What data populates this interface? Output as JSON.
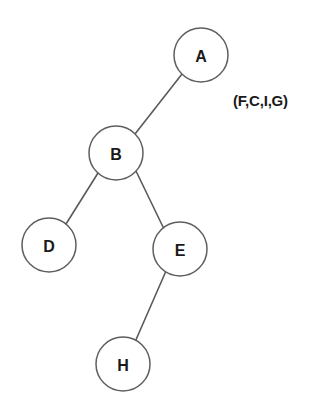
{
  "canvas": {
    "width": 322,
    "height": 414,
    "background": "#ffffff"
  },
  "style": {
    "node_stroke": "#5f5f5f",
    "node_fill": "#ffffff",
    "edge_stroke": "#5a5a5a",
    "label_color": "#1a1a1a"
  },
  "diagram": {
    "type": "tree",
    "title": "",
    "node_radius": 27,
    "nodes": [
      {
        "id": "A",
        "label": "A",
        "cx": 201,
        "cy": 55,
        "r": 27
      },
      {
        "id": "B",
        "label": "B",
        "cx": 116,
        "cy": 153,
        "r": 27
      },
      {
        "id": "D",
        "label": "D",
        "cx": 49,
        "cy": 245,
        "r": 27
      },
      {
        "id": "E",
        "label": "E",
        "cx": 180,
        "cy": 249,
        "r": 27
      },
      {
        "id": "H",
        "label": "H",
        "cx": 123,
        "cy": 364,
        "r": 27
      }
    ],
    "edges": [
      {
        "from": "A",
        "to": "B",
        "x1": 182,
        "y1": 74,
        "x2": 135,
        "y2": 134
      },
      {
        "from": "B",
        "to": "D",
        "x1": 98,
        "y1": 173,
        "x2": 66,
        "y2": 224
      },
      {
        "from": "B",
        "to": "E",
        "x1": 136,
        "y1": 171,
        "x2": 164,
        "y2": 229
      },
      {
        "from": "E",
        "to": "H",
        "x1": 166,
        "y1": 271,
        "x2": 135,
        "y2": 342
      }
    ],
    "annotations": [
      {
        "id": "set-label",
        "text": "(F,C,I,G)",
        "x": 233,
        "y": 92
      }
    ]
  }
}
